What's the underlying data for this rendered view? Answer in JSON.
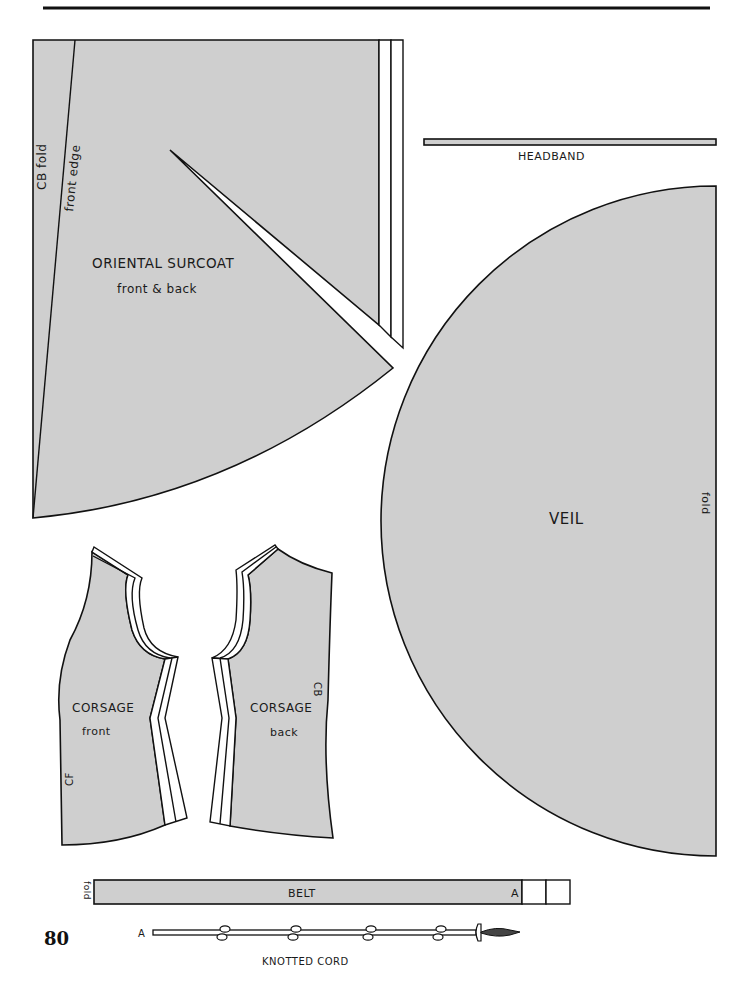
{
  "page": {
    "number": "80",
    "colors": {
      "pattern_fill": "#cfcfcf",
      "outline": "#111111",
      "paper": "#ffffff"
    }
  },
  "pieces": {
    "surcoat": {
      "title": "ORIENTAL SURCOAT",
      "subtitle": "front & back",
      "label_cb_fold": "CB fold",
      "label_front_edge": "front edge"
    },
    "headband": {
      "title": "HEADBAND"
    },
    "veil": {
      "title": "VEIL",
      "label_fold": "fold"
    },
    "corsage_front": {
      "title": "CORSAGE",
      "subtitle": "front",
      "label_cf": "CF"
    },
    "corsage_back": {
      "title": "CORSAGE",
      "subtitle": "back",
      "label_cb": "CB"
    },
    "belt": {
      "title": "BELT",
      "label_fold": "fold",
      "marker": "A"
    },
    "knotted_cord": {
      "title": "KNOTTED CORD",
      "marker": "A",
      "knot_count": 4
    }
  }
}
